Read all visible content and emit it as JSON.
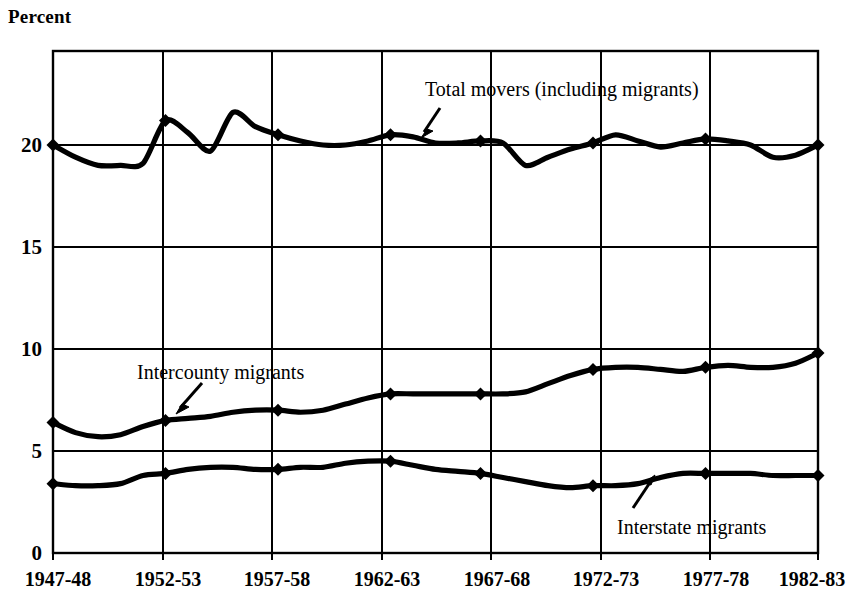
{
  "chart_data": {
    "type": "line",
    "title": "",
    "ylabel": "Percent",
    "xlabel": "",
    "ylim": [
      0,
      23.5
    ],
    "yticks": [
      0,
      5,
      10,
      15,
      20
    ],
    "ytick_labels": [
      "0",
      "5",
      "10",
      "15",
      "20"
    ],
    "grid": true,
    "grid_style": "vertical gridlines at each tick, horizontal gridlines at 5/10/15/20",
    "legend_position": "inline annotations with arrows",
    "categories": [
      "1947-48",
      "1952-53",
      "1957-58",
      "1962-63",
      "1967-68",
      "1972-73",
      "1977-78",
      "1982-83"
    ],
    "series": [
      {
        "name": "Total movers (including migrants)",
        "values": [
          20.0,
          20.6,
          20.0,
          20.1,
          19.0,
          20.5,
          20.2,
          20.0
        ],
        "annual_values": [
          20.0,
          19.4,
          19.0,
          19.0,
          19.1,
          21.2,
          20.6,
          19.7,
          21.6,
          20.9,
          20.5,
          20.2,
          20.0,
          20.0,
          20.2,
          20.5,
          20.4,
          20.1,
          20.1,
          20.2,
          20.1,
          19.0,
          19.4,
          19.8,
          20.1,
          20.5,
          20.2,
          19.9,
          20.1,
          20.3,
          20.2,
          20.0,
          19.4,
          19.5,
          20.0
        ],
        "marker": "diamond"
      },
      {
        "name": "Intercounty migrants",
        "values": [
          6.4,
          6.6,
          7.0,
          7.8,
          7.9,
          9.1,
          9.2,
          9.8
        ],
        "annual_values": [
          6.4,
          5.9,
          5.7,
          5.8,
          6.2,
          6.5,
          6.6,
          6.7,
          6.9,
          7.0,
          7.0,
          6.9,
          7.0,
          7.3,
          7.6,
          7.8,
          7.8,
          7.8,
          7.8,
          7.8,
          7.8,
          7.9,
          8.3,
          8.7,
          9.0,
          9.1,
          9.1,
          9.0,
          8.9,
          9.1,
          9.2,
          9.1,
          9.1,
          9.3,
          9.8
        ],
        "marker": "diamond"
      },
      {
        "name": "Interstate migrants",
        "values": [
          3.4,
          4.1,
          4.2,
          4.5,
          3.5,
          3.3,
          3.9,
          3.8
        ],
        "annual_values": [
          3.4,
          3.3,
          3.3,
          3.4,
          3.8,
          3.9,
          4.1,
          4.2,
          4.2,
          4.1,
          4.1,
          4.2,
          4.2,
          4.4,
          4.5,
          4.5,
          4.3,
          4.1,
          4.0,
          3.9,
          3.7,
          3.5,
          3.3,
          3.2,
          3.3,
          3.3,
          3.4,
          3.7,
          3.9,
          3.9,
          3.9,
          3.9,
          3.8,
          3.8,
          3.8
        ],
        "marker": "diamond"
      }
    ],
    "annotations": [
      {
        "text": "Total movers (including migrants)",
        "series": "Total movers (including migrants)"
      },
      {
        "text": "Intercounty migrants",
        "series": "Intercounty migrants"
      },
      {
        "text": "Interstate migrants",
        "series": "Interstate migrants"
      }
    ],
    "colors": {
      "line": "#000000",
      "grid": "#000000",
      "background": "#ffffff"
    }
  }
}
